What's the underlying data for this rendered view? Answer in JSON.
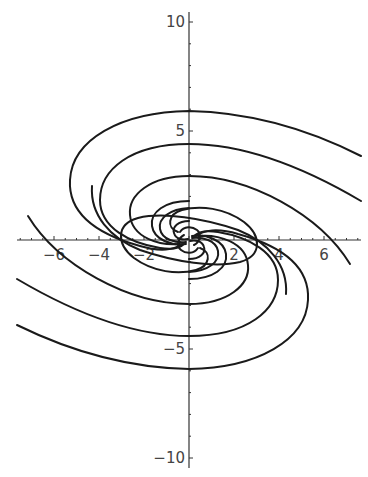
{
  "chart_data": {
    "type": "line",
    "title": "",
    "subtitle": "",
    "xlabel": "",
    "ylabel": "",
    "xlim": [
      -7.6,
      7.6
    ],
    "ylim": [
      -10.5,
      10.5
    ],
    "grid": false,
    "legend": null,
    "x_ticks": [
      -6,
      -4,
      -2,
      2,
      4,
      6
    ],
    "x_tick_labels": [
      "-6",
      "-4",
      "-2",
      "2",
      "4",
      "6"
    ],
    "y_ticks": [
      -10,
      -5,
      5,
      10
    ],
    "y_tick_labels": [
      "-10",
      "-5",
      "5",
      "10"
    ],
    "series": [
      {
        "name": "trajectory-1",
        "start": [
          7.6,
          3.8
        ],
        "y_at_x0_crossings": [
          5.9,
          -1.1
        ]
      },
      {
        "name": "trajectory-2",
        "start": [
          -7.6,
          -3.8
        ],
        "y_at_x0_crossings": [
          -5.9,
          1.1
        ]
      },
      {
        "name": "trajectory-3",
        "start": [
          7.6,
          1.9
        ],
        "y_at_x0_crossings": [
          4.4,
          -0.8
        ]
      },
      {
        "name": "trajectory-4",
        "start": [
          -7.6,
          -1.9
        ],
        "y_at_x0_crossings": [
          -4.4,
          0.8
        ]
      },
      {
        "name": "trajectory-5",
        "start": [
          6.6,
          0.0
        ],
        "y_at_x0_crossings": [
          2.5,
          -0.5
        ]
      },
      {
        "name": "trajectory-6",
        "start": [
          -6.6,
          0.0
        ],
        "y_at_x0_crossings": [
          -2.5,
          0.5
        ]
      },
      {
        "name": "trajectory-7",
        "start": [
          -4.0,
          3.9
        ],
        "y_at_x0_crossings": [
          -2.3,
          1.5
        ]
      },
      {
        "name": "trajectory-8",
        "start": [
          4.0,
          -3.9
        ],
        "y_at_x0_crossings": [
          2.3,
          -1.5
        ]
      }
    ]
  }
}
